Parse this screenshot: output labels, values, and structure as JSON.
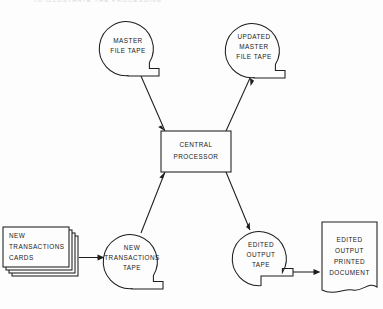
{
  "diagram": {
    "title_fragment": "TO ILLUSTRATE THE PROCESSING",
    "type": "data-processing-flowchart",
    "colors": {
      "background": "#fdfdfd",
      "line": "#1d1d1d",
      "text": "#1a1a1a"
    },
    "nodes": [
      {
        "id": "master-file-tape",
        "symbol": "magnetic-tape",
        "lines": [
          "MASTER",
          "FILE TAPE"
        ]
      },
      {
        "id": "updated-master-file-tape",
        "symbol": "magnetic-tape",
        "lines": [
          "UPDATED",
          "MASTER",
          "FILE TAPE"
        ]
      },
      {
        "id": "central-processor",
        "symbol": "process-box",
        "lines": [
          "CENTRAL",
          "PROCESSOR"
        ]
      },
      {
        "id": "new-transactions-cards",
        "symbol": "punched-card-deck",
        "lines": [
          "NEW",
          "TRANSACTIONS",
          "CARDS"
        ]
      },
      {
        "id": "new-transactions-tape",
        "symbol": "magnetic-tape",
        "lines": [
          "NEW",
          "TRANSACTIONS",
          "TAPE"
        ]
      },
      {
        "id": "edited-output-tape",
        "symbol": "magnetic-tape",
        "lines": [
          "EDITED",
          "OUTPUT",
          "TAPE"
        ]
      },
      {
        "id": "edited-output-printed-document",
        "symbol": "document",
        "lines": [
          "EDITED",
          "OUTPUT",
          "PRINTED",
          "DOCUMENT"
        ]
      }
    ],
    "edges": [
      {
        "id": "master-to-processor",
        "from": "master-file-tape",
        "to": "central-processor",
        "arrow": "to"
      },
      {
        "id": "processor-to-updated-master",
        "from": "central-processor",
        "to": "updated-master-file-tape",
        "arrow": "to"
      },
      {
        "id": "cards-to-new-transactions-tape",
        "from": "new-transactions-cards",
        "to": "new-transactions-tape",
        "arrow": "to"
      },
      {
        "id": "new-transactions-tape-to-processor",
        "from": "new-transactions-tape",
        "to": "central-processor",
        "arrow": "to"
      },
      {
        "id": "processor-to-edited-output-tape",
        "from": "central-processor",
        "to": "edited-output-tape",
        "arrow": "to"
      },
      {
        "id": "edited-output-tape-to-document",
        "from": "edited-output-tape",
        "to": "edited-output-printed-document",
        "arrow": "to"
      }
    ]
  }
}
